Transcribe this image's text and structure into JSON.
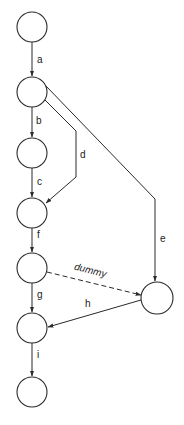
{
  "diagram": {
    "type": "activity-network",
    "nodes": [
      {
        "id": "n1",
        "cx": 32,
        "cy": 27,
        "r": 15
      },
      {
        "id": "n2",
        "cx": 32,
        "cy": 92,
        "r": 15
      },
      {
        "id": "n3",
        "cx": 32,
        "cy": 153,
        "r": 15
      },
      {
        "id": "n4",
        "cx": 32,
        "cy": 213,
        "r": 15
      },
      {
        "id": "n5",
        "cx": 32,
        "cy": 268,
        "r": 15
      },
      {
        "id": "n6",
        "cx": 32,
        "cy": 328,
        "r": 15
      },
      {
        "id": "n7",
        "cx": 32,
        "cy": 392,
        "r": 15
      },
      {
        "id": "n8",
        "cx": 157,
        "cy": 298,
        "r": 16
      }
    ],
    "edges": [
      {
        "id": "a",
        "label": "a",
        "from": "n1",
        "to": "n2",
        "style": "solid"
      },
      {
        "id": "b",
        "label": "b",
        "from": "n2",
        "to": "n3",
        "style": "solid"
      },
      {
        "id": "c",
        "label": "c",
        "from": "n3",
        "to": "n4",
        "style": "solid"
      },
      {
        "id": "d",
        "label": "d",
        "from": "n2",
        "to": "n4",
        "style": "solid"
      },
      {
        "id": "e",
        "label": "e",
        "from": "n2",
        "to": "n8",
        "style": "solid"
      },
      {
        "id": "f",
        "label": "f",
        "from": "n4",
        "to": "n5",
        "style": "solid"
      },
      {
        "id": "dummy",
        "label": "dummy",
        "from": "n5",
        "to": "n8",
        "style": "dashed"
      },
      {
        "id": "g",
        "label": "g",
        "from": "n5",
        "to": "n6",
        "style": "solid"
      },
      {
        "id": "h",
        "label": "h",
        "from": "n8",
        "to": "n6",
        "style": "solid"
      },
      {
        "id": "i",
        "label": "i",
        "from": "n6",
        "to": "n7",
        "style": "solid"
      }
    ],
    "colors": {
      "stroke": "#2a2a2a",
      "background": "#ffffff"
    }
  },
  "labels": {
    "a": "a",
    "b": "b",
    "c": "c",
    "d": "d",
    "e": "e",
    "f": "f",
    "g": "g",
    "h": "h",
    "i": "i",
    "dummy": "dummy"
  }
}
